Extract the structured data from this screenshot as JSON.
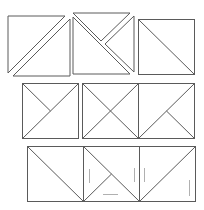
{
  "diagram": {
    "stroke_color": "#5a5a5a",
    "faint_color": "#b0b0b0",
    "rows": [
      {
        "row": 1,
        "figures": [
          {
            "name": "square split diagonally with gap (two separated triangles)"
          },
          {
            "name": "square split into three pieces (top triangle, right triangle, lower-left triangle) with gaps"
          },
          {
            "name": "square with single diagonal top-left to bottom-right"
          }
        ]
      },
      {
        "row": 2,
        "figures": [
          {
            "name": "square with diagonal and half-diagonal from top-left to center"
          },
          {
            "name": "square with full X diagonals"
          },
          {
            "name": "square with diagonal and half-diagonal from center to bottom-right"
          }
        ]
      },
      {
        "row": 3,
        "figures": [
          {
            "name": "square with diagonal top-left to bottom-right"
          },
          {
            "name": "square with diagonal and half-diagonal from bottom-left to center, faint guide marks"
          },
          {
            "name": "square with diagonal bottom-left to top-right, faint guide marks"
          }
        ]
      }
    ]
  }
}
